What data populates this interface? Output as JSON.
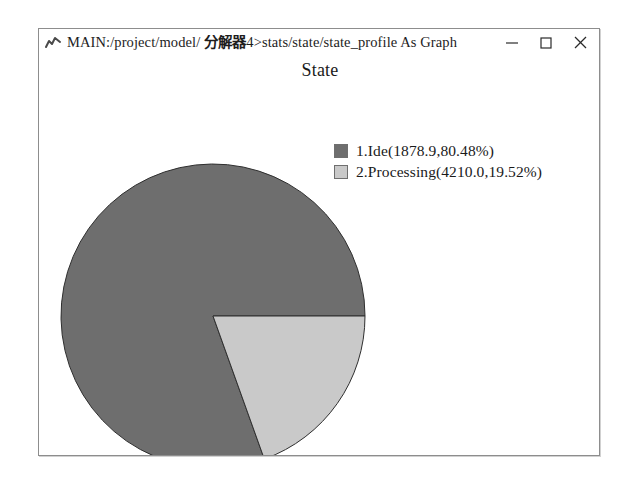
{
  "window": {
    "icon": "line-chart-icon",
    "title_prefix": "MAIN:/project/model/ ",
    "title_cjk": "分解器",
    "title_suffix": "4>stats/state/state_profile As Graph",
    "title_full": "MAIN:/project/model/ 分解器4>stats/state/state_profile As Graph",
    "controls": {
      "minimize": "minimize-icon",
      "maximize": "maximize-icon",
      "close": "close-icon"
    }
  },
  "chart_data": {
    "type": "pie",
    "title": "State",
    "xlabel": "",
    "ylabel": "",
    "legend_position": "top-right",
    "start_angle_deg": 0,
    "direction": "counterclockwise",
    "categories": [
      "Ide",
      "Processing"
    ],
    "values": [
      1878.9,
      4210.0
    ],
    "percentages": [
      80.48,
      19.52
    ],
    "colors": [
      "#6e6e6e",
      "#c9c9c9"
    ],
    "slices": [
      {
        "index": 1,
        "name": "Ide",
        "value": 1878.9,
        "percent": 80.48,
        "color": "#6e6e6e",
        "legend_label": "1.Ide(1878.9,80.48%)"
      },
      {
        "index": 2,
        "name": "Processing",
        "value": 4210.0,
        "percent": 19.52,
        "color": "#c9c9c9",
        "legend_label": "2.Processing(4210.0,19.52%)"
      }
    ]
  }
}
